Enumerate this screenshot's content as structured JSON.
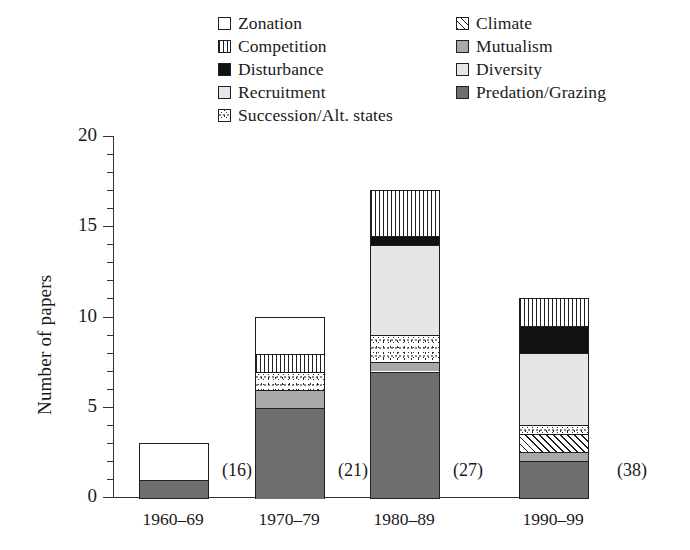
{
  "chart_data": {
    "type": "bar",
    "subtype": "stacked-bar",
    "title": "",
    "xlabel": "",
    "ylabel": "Number of papers",
    "ylim": [
      0,
      20
    ],
    "ytick_labels": [
      "0",
      "5",
      "10",
      "15",
      "20"
    ],
    "ytick_values": [
      0,
      5,
      10,
      15,
      20
    ],
    "minor_tick_step": 1,
    "grid": false,
    "legend_position": "top-center",
    "categories": [
      "1960–69",
      "1970–79",
      "1980–89",
      "1990–99"
    ],
    "category_annotations": [
      "(16)",
      "(21)",
      "(27)",
      "(38)"
    ],
    "totals": [
      3,
      10,
      17,
      11
    ],
    "series": [
      {
        "name": "Predation/Grazing",
        "pattern": "dark-gray",
        "values": [
          1,
          5,
          7,
          2
        ]
      },
      {
        "name": "Mutualism",
        "pattern": "medium-gray",
        "values": [
          0,
          1,
          0.5,
          0.5
        ]
      },
      {
        "name": "Climate",
        "pattern": "diagonal-hatch",
        "values": [
          0,
          0,
          0,
          1
        ]
      },
      {
        "name": "Succession/Alt. states",
        "pattern": "speckled",
        "values": [
          0,
          1,
          1.5,
          0.5
        ]
      },
      {
        "name": "Recruitment",
        "pattern": "very-light-gray",
        "values": [
          0,
          0,
          0,
          0
        ]
      },
      {
        "name": "Diversity",
        "pattern": "light-gray",
        "values": [
          0,
          0,
          5,
          4
        ]
      },
      {
        "name": "Disturbance",
        "pattern": "black",
        "values": [
          0,
          0,
          0.5,
          1.5
        ]
      },
      {
        "name": "Competition",
        "pattern": "vertical-lines",
        "values": [
          0,
          1,
          2.5,
          1.5
        ]
      },
      {
        "name": "Zonation",
        "pattern": "blank",
        "values": [
          2,
          2,
          0,
          0
        ]
      }
    ]
  },
  "legend": {
    "left_column": [
      {
        "label": "Zonation",
        "pattern": "blank"
      },
      {
        "label": "Competition",
        "pattern": "vertical-lines"
      },
      {
        "label": "Disturbance",
        "pattern": "black"
      },
      {
        "label": "Recruitment",
        "pattern": "very-light-gray"
      },
      {
        "label": "Succession/Alt. states",
        "pattern": "speckled"
      }
    ],
    "right_column": [
      {
        "label": "Climate",
        "pattern": "diagonal-hatch"
      },
      {
        "label": "Mutualism",
        "pattern": "medium-gray"
      },
      {
        "label": "Diversity",
        "pattern": "light-gray"
      },
      {
        "label": "Predation/Grazing",
        "pattern": "dark-gray"
      }
    ]
  },
  "colors": {
    "axis": "#333333",
    "outline": "#1f1f1f",
    "black_fill": "#111111",
    "dark_gray_fill": "#6e6e6e",
    "medium_gray_fill": "#a8a8a8",
    "light_gray_fill": "#e6e6e6",
    "very_light_gray_fill": "#ededed",
    "background": "#ffffff"
  }
}
